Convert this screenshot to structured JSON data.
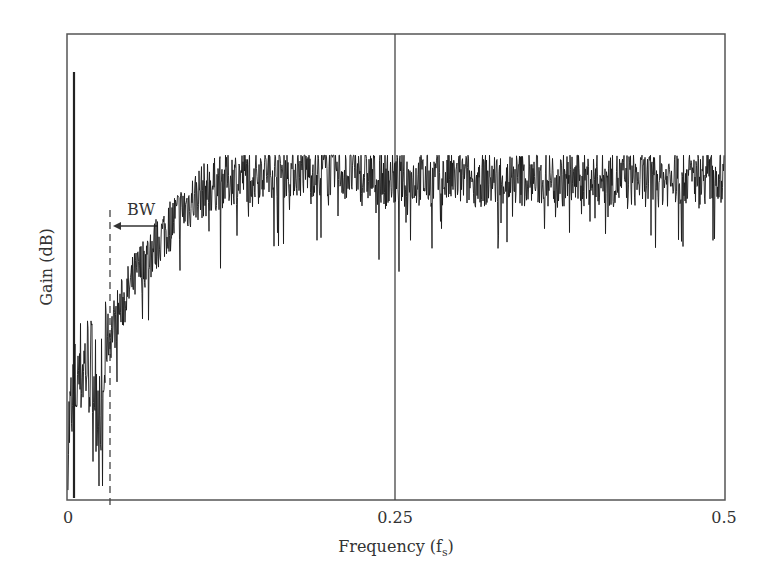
{
  "chart_data": {
    "type": "line",
    "title": "",
    "xlabel": "Frequency (f_s)",
    "xlabel_main": "Frequency (f",
    "xlabel_sub": "s",
    "xlabel_close": ")",
    "ylabel": "Gain (dB)",
    "xlim": [
      0,
      0.5
    ],
    "ylim": [
      0,
      1
    ],
    "xticks": [
      0,
      0.25,
      0.5
    ],
    "xtick_labels": [
      "0",
      "0.25",
      "0.5"
    ],
    "yticks": [],
    "grid": false,
    "legend": null,
    "annotations": [
      {
        "text": "BW",
        "type": "arrow-left",
        "x": 0.033,
        "description": "Bandwidth marker with leftward arrow pointing to dashed line"
      },
      {
        "type": "dashed-vline",
        "x": 0.033
      },
      {
        "type": "solid-vline",
        "x": 0.25
      },
      {
        "type": "spike",
        "x": 0.005,
        "y": 0.92
      }
    ],
    "series": [
      {
        "name": "Gain spectrum (noisy)",
        "description": "Noisy spectrum: low bump near 0.01-0.025, dip near 0.027, rising steeply from 0.03 to plateau ~0.12, flat plateau to 0.5",
        "x": [
          0,
          0.005,
          0.01,
          0.015,
          0.02,
          0.025,
          0.03,
          0.04,
          0.05,
          0.06,
          0.07,
          0.08,
          0.09,
          0.1,
          0.12,
          0.15,
          0.2,
          0.25,
          0.3,
          0.35,
          0.4,
          0.45,
          0.5
        ],
        "values": [
          0.15,
          0.25,
          0.3,
          0.32,
          0.3,
          0.22,
          0.35,
          0.42,
          0.48,
          0.53,
          0.57,
          0.61,
          0.64,
          0.67,
          0.7,
          0.72,
          0.72,
          0.7,
          0.7,
          0.7,
          0.7,
          0.7,
          0.71
        ]
      }
    ]
  },
  "labels": {
    "x_tick_0": "0",
    "x_tick_1": "0.25",
    "x_tick_2": "0.5",
    "y_title": "Gain (dB)",
    "x_title_main": "Frequency (f",
    "x_title_sub": "s",
    "x_title_close": ")",
    "bw": "BW"
  },
  "colors": {
    "line": "#1a1a1a",
    "axis": "#444444",
    "text": "#333333"
  }
}
